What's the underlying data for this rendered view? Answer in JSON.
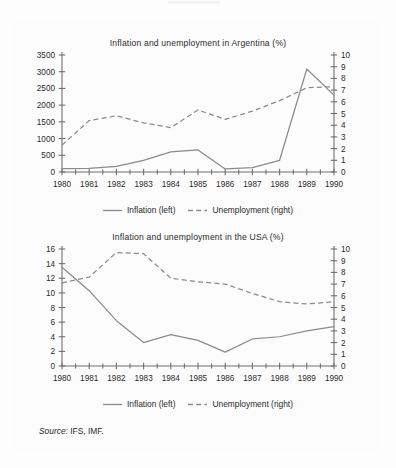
{
  "source_note": {
    "key": "Source:",
    "value": " IFS, IMF."
  },
  "legend": {
    "inflation_label": "Inflation (left)",
    "unemployment_label": "Unemployment (right)",
    "inflation_style": "solid-line",
    "unemployment_style": "dashed-line"
  },
  "colors": {
    "series": "#8b8b8b",
    "axis": "#6f6f6f",
    "text": "#2b2b2b",
    "background": "#fdfdfd"
  },
  "chart_data": [
    {
      "id": "argentina",
      "type": "line",
      "title": "Inflation and unemployment in Argentina (%)",
      "xlabel": "",
      "ylabel": "",
      "grid": false,
      "legend_position": "bottom",
      "x": [
        1980,
        1981,
        1982,
        1983,
        1984,
        1985,
        1986,
        1987,
        1988,
        1989,
        1990
      ],
      "xtick_labels": [
        "1980",
        "1981",
        "1982",
        "1983",
        "1984",
        "1985",
        "1986",
        "1987",
        "1988",
        "1989",
        "1990"
      ],
      "left_axis": {
        "name": "Inflation (left)",
        "ylim": [
          0,
          3500
        ],
        "ticks": [
          0,
          500,
          1000,
          1500,
          2000,
          2500,
          3000,
          3500
        ],
        "tick_labels": [
          "0",
          "500",
          "1000",
          "1500",
          "2000",
          "2500",
          "3000",
          "3500"
        ]
      },
      "right_axis": {
        "name": "Unemployment (right)",
        "ylim": [
          0,
          10
        ],
        "ticks": [
          0,
          1,
          2,
          3,
          4,
          5,
          6,
          7,
          8,
          9,
          10
        ],
        "tick_labels": [
          "0",
          "1",
          "2",
          "3",
          "4",
          "5",
          "6",
          "7",
          "8",
          "9",
          "10"
        ]
      },
      "series": [
        {
          "name": "Inflation (left)",
          "axis": "left",
          "style": "solid",
          "values": [
            100,
            105,
            165,
            345,
            600,
            660,
            90,
            130,
            350,
            3080,
            2300
          ]
        },
        {
          "name": "Unemployment (right)",
          "axis": "right",
          "style": "dashed",
          "values": [
            2.3,
            4.4,
            4.8,
            4.2,
            3.8,
            5.3,
            4.5,
            5.2,
            6.1,
            7.2,
            7.3
          ]
        }
      ]
    },
    {
      "id": "usa",
      "type": "line",
      "title": "Inflation and unemployment in the USA (%)",
      "xlabel": "",
      "ylabel": "",
      "grid": false,
      "legend_position": "bottom",
      "x": [
        1980,
        1981,
        1982,
        1983,
        1984,
        1985,
        1986,
        1987,
        1988,
        1989,
        1990
      ],
      "xtick_labels": [
        "1980",
        "1981",
        "1982",
        "1983",
        "1984",
        "1985",
        "1986",
        "1987",
        "1988",
        "1989",
        "1990"
      ],
      "left_axis": {
        "name": "Inflation (left)",
        "ylim": [
          0,
          16
        ],
        "ticks": [
          0,
          2,
          4,
          6,
          8,
          10,
          12,
          14,
          16
        ],
        "tick_labels": [
          "0",
          "2",
          "4",
          "6",
          "8",
          "10",
          "12",
          "14",
          "16"
        ]
      },
      "right_axis": {
        "name": "Unemployment (right)",
        "ylim": [
          0,
          10
        ],
        "ticks": [
          0,
          1,
          2,
          3,
          4,
          5,
          6,
          7,
          8,
          9,
          10
        ],
        "tick_labels": [
          "0",
          "1",
          "2",
          "3",
          "4",
          "5",
          "6",
          "7",
          "8",
          "9",
          "10"
        ]
      },
      "series": [
        {
          "name": "Inflation (left)",
          "axis": "left",
          "style": "solid",
          "values": [
            13.5,
            10.3,
            6.2,
            3.2,
            4.3,
            3.5,
            1.9,
            3.7,
            4.0,
            4.8,
            5.4
          ]
        },
        {
          "name": "Unemployment (right)",
          "axis": "right",
          "style": "dashed",
          "values": [
            7.1,
            7.6,
            9.7,
            9.6,
            7.5,
            7.2,
            7.0,
            6.2,
            5.5,
            5.3,
            5.5
          ]
        }
      ]
    }
  ]
}
